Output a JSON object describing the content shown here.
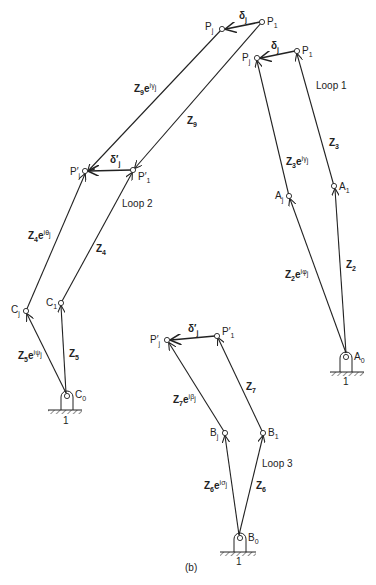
{
  "figure": {
    "caption": "(b)",
    "loops": [
      {
        "label": "Loop 1",
        "x": 304,
        "y": 86
      },
      {
        "label": "Loop 2",
        "x": 122,
        "y": 205
      },
      {
        "label": "Loop 3",
        "x": 262,
        "y": 465
      }
    ],
    "points": {
      "P1_top": {
        "label": "P",
        "sub": "1",
        "x": 262,
        "y": 22
      },
      "Pj_top": {
        "label": "P",
        "sub": "j",
        "x": 222,
        "y": 29
      },
      "P1_right": {
        "label": "P",
        "sub": "1",
        "x": 297,
        "y": 51
      },
      "Pj_right": {
        "label": "P",
        "sub": "j",
        "x": 257,
        "y": 58
      },
      "Pj_prime_mid": {
        "label": "P′",
        "sub": "j",
        "x": 85,
        "y": 170
      },
      "P1_prime_mid": {
        "label": "P′",
        "sub": "1",
        "x": 133,
        "y": 170
      },
      "Aj": {
        "label": "A",
        "sub": "j",
        "x": 289,
        "y": 196
      },
      "A1": {
        "label": "A",
        "sub": "1",
        "x": 334,
        "y": 186
      },
      "A0": {
        "label": "A",
        "sub": "0",
        "x": 347,
        "y": 355
      },
      "Cj": {
        "label": "C",
        "sub": "j",
        "x": 26,
        "y": 311
      },
      "C1": {
        "label": "C",
        "sub": "1",
        "x": 61,
        "y": 303
      },
      "C0": {
        "label": "C",
        "sub": "0",
        "x": 67,
        "y": 395
      },
      "Pj_prime_bot": {
        "label": "P′",
        "sub": "j",
        "x": 167,
        "y": 340
      },
      "P1_prime_bot": {
        "label": "P′",
        "sub": "1",
        "x": 217,
        "y": 335
      },
      "Bj": {
        "label": "B",
        "sub": "j",
        "x": 225,
        "y": 433
      },
      "B1": {
        "label": "B",
        "sub": "1",
        "x": 263,
        "y": 433
      },
      "B0": {
        "label": "B",
        "sub": "0",
        "x": 240,
        "y": 537
      }
    },
    "ground_labels": [
      {
        "text": "1",
        "x": 346,
        "y": 382
      },
      {
        "text": "1",
        "x": 66,
        "y": 421
      },
      {
        "text": "1",
        "x": 239,
        "y": 560
      }
    ],
    "vectors": {
      "Z9_e_gamma": {
        "main": "Z",
        "sub": "9",
        "exp": "e",
        "sup": "iγ",
        "supsub": "j"
      },
      "Z9": {
        "main": "Z",
        "sub": "9"
      },
      "delta_j_top": {
        "main": "δ",
        "sub": "j"
      },
      "delta_j_right": {
        "main": "δ",
        "sub": "j"
      },
      "delta_j_prime_mid": {
        "main": "δ′",
        "sub": "j"
      },
      "delta_j_prime_bot": {
        "main": "δ′",
        "sub": "j"
      },
      "Z3_e_gamma": {
        "main": "Z",
        "sub": "3",
        "exp": "e",
        "sup": "iγ",
        "supsub": "j"
      },
      "Z3": {
        "main": "Z",
        "sub": "3"
      },
      "Z2_e_phi": {
        "main": "Z",
        "sub": "2",
        "exp": "e",
        "sup": "iφ",
        "supsub": "j"
      },
      "Z2": {
        "main": "Z",
        "sub": "2"
      },
      "Z4_e_theta": {
        "main": "Z",
        "sub": "4",
        "exp": "e",
        "sup": "iθ",
        "supsub": "j"
      },
      "Z4": {
        "main": "Z",
        "sub": "4"
      },
      "Z5_e_psi": {
        "main": "Z",
        "sub": "5",
        "exp": "e",
        "sup": "iψ",
        "supsub": "j"
      },
      "Z5": {
        "main": "Z",
        "sub": "5"
      },
      "Z7_e_beta": {
        "main": "Z",
        "sub": "7",
        "exp": "e",
        "sup": "iβ",
        "supsub": "j"
      },
      "Z7": {
        "main": "Z",
        "sub": "7"
      },
      "Z6_e_sigma": {
        "main": "Z",
        "sub": "6",
        "exp": "e",
        "sup": "iσ",
        "supsub": "j"
      },
      "Z6": {
        "main": "Z",
        "sub": "6"
      }
    }
  }
}
